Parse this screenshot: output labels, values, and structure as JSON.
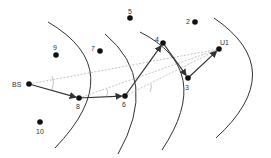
{
  "diagram": {
    "title": "",
    "colors": {
      "node": "#111111",
      "arc": "#333333",
      "path": "#333333",
      "ray": "#aaaaaa"
    },
    "nodes": [
      {
        "id": "BS",
        "label": "BS",
        "x": 29,
        "y": 84,
        "lx": 12,
        "ly": 87
      },
      {
        "id": "8",
        "label": "8",
        "x": 79,
        "y": 98,
        "lx": 76,
        "ly": 109
      },
      {
        "id": "6",
        "label": "6",
        "x": 125,
        "y": 96,
        "lx": 122,
        "ly": 107
      },
      {
        "id": "4",
        "label": "4",
        "x": 163,
        "y": 43,
        "lx": 155,
        "ly": 42
      },
      {
        "id": "3",
        "label": "3",
        "x": 188,
        "y": 78,
        "lx": 185,
        "ly": 90
      },
      {
        "id": "U1",
        "label": "U1",
        "x": 219,
        "y": 49,
        "lx": 220,
        "ly": 45
      },
      {
        "id": "5",
        "label": "5",
        "x": 130,
        "y": 18,
        "lx": 128,
        "ly": 14
      },
      {
        "id": "2",
        "label": "2",
        "x": 195,
        "y": 22,
        "lx": 186,
        "ly": 24
      },
      {
        "id": "9",
        "label": "9",
        "x": 56,
        "y": 55,
        "lx": 53,
        "ly": 50
      },
      {
        "id": "7",
        "label": "7",
        "x": 100,
        "y": 51,
        "lx": 91,
        "ly": 51
      },
      {
        "id": "10",
        "label": "10",
        "x": 40,
        "y": 122,
        "lx": 36,
        "ly": 134
      }
    ],
    "route": [
      "BS",
      "8",
      "6",
      "4",
      "3",
      "U1"
    ],
    "rays": [
      {
        "from": "BS",
        "to": "U1"
      },
      {
        "from": "8",
        "to": "U1"
      },
      {
        "from": "6",
        "to": "U1"
      }
    ]
  }
}
